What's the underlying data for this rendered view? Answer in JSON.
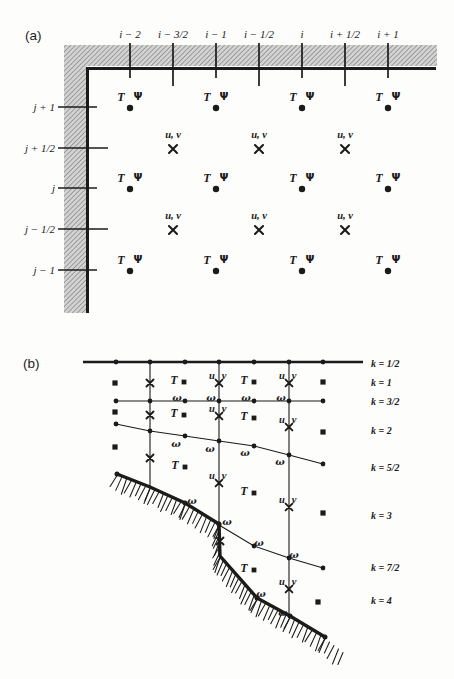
{
  "figure": {
    "ink_color": "#1b1b1b",
    "wall_fill": "#d3d3d3",
    "wall_line": "#7f7f7f",
    "panel_a": {
      "label": "(a)",
      "point_labels": {
        "t": "T",
        "psi": "Ψ",
        "uv": "u, v"
      },
      "columns": [
        {
          "label": "i − 2",
          "x": 130,
          "half": false
        },
        {
          "label": "i − 3/2",
          "x": 173,
          "half": true
        },
        {
          "label": "i − 1",
          "x": 216,
          "half": false
        },
        {
          "label": "i − 1/2",
          "x": 259,
          "half": true
        },
        {
          "label": "i",
          "x": 302,
          "half": false
        },
        {
          "label": "i + 1/2",
          "x": 345,
          "half": true
        },
        {
          "label": "i + 1",
          "x": 388,
          "half": false
        }
      ],
      "rows": [
        {
          "label": "j + 1",
          "y": 107,
          "half": false
        },
        {
          "label": "j + 1/2",
          "y": 148,
          "half": true
        },
        {
          "label": "j",
          "y": 188,
          "half": false
        },
        {
          "label": "j − 1/2",
          "y": 229,
          "half": true
        },
        {
          "label": "j − 1",
          "y": 270,
          "half": false
        }
      ],
      "wall": {
        "top_band": [
          64,
          45,
          373,
          21
        ],
        "left_band": [
          64,
          45,
          23,
          268
        ],
        "boundary": "M436 68.5 L87.5 68.5 L87.5 313"
      }
    },
    "panel_b": {
      "label": "(b)",
      "point_labels": {
        "t": "T",
        "u": "u",
        "v": "v",
        "omega": "ω"
      },
      "vertical_lines": [
        [
          150,
          362,
          487
        ],
        [
          219,
          362,
          555
        ],
        [
          289,
          362,
          616
        ]
      ],
      "levels": [
        {
          "thick": true,
          "pts": [
            [
              83,
              362
            ],
            [
              363,
              362
            ]
          ],
          "dots": [
            [
              116,
              362
            ],
            [
              150,
              362
            ],
            [
              185,
              362
            ],
            [
              219,
              362
            ],
            [
              254,
              362
            ],
            [
              289,
              362
            ],
            [
              323,
              362
            ]
          ],
          "omegas": []
        },
        {
          "thick": false,
          "pts": [
            [
              116,
              401
            ],
            [
              323,
              401
            ]
          ],
          "dots": [
            [
              116,
              401
            ],
            [
              150,
              401
            ],
            [
              185,
              401
            ],
            [
              219,
              401
            ],
            [
              254,
              401
            ],
            [
              289,
              401
            ],
            [
              323,
              401
            ]
          ],
          "omegas": [
            [
              177,
              398
            ],
            [
              211,
              398
            ],
            [
              246,
              398
            ],
            [
              281,
              398
            ]
          ]
        },
        {
          "thick": false,
          "pts": [
            [
              116,
              424
            ],
            [
              150,
              431
            ],
            [
              185,
              436
            ],
            [
              219,
              441
            ],
            [
              254,
              446
            ],
            [
              289,
              455
            ],
            [
              323,
              464
            ]
          ],
          "dots": [
            [
              116,
              424
            ],
            [
              150,
              431
            ],
            [
              185,
              436
            ],
            [
              219,
              441
            ],
            [
              254,
              446
            ],
            [
              289,
              455
            ],
            [
              323,
              464
            ]
          ],
          "omegas": [
            [
              176,
              444
            ],
            [
              210,
              449
            ],
            [
              245,
              453
            ],
            [
              280,
              462
            ]
          ]
        },
        {
          "thick": false,
          "pts": [
            [
              219,
              525
            ],
            [
              254,
              546
            ],
            [
              289,
              558
            ],
            [
              323,
              568
            ]
          ],
          "dots": [
            [
              219,
              525
            ],
            [
              254,
              546
            ],
            [
              289,
              558
            ],
            [
              323,
              568
            ]
          ],
          "omegas": [
            [
              259,
              543
            ],
            [
              294,
              555
            ]
          ]
        }
      ],
      "bottom": {
        "pts": [
          [
            117,
            474
          ],
          [
            150,
            487
          ],
          [
            185,
            503
          ],
          [
            219,
            524
          ],
          [
            220,
            556
          ],
          [
            257,
            598
          ],
          [
            290,
            616
          ],
          [
            325,
            637
          ]
        ],
        "hatch_tail": [
          343,
          651
        ],
        "dots": [
          [
            117,
            474
          ],
          [
            185,
            503
          ],
          [
            219,
            524
          ],
          [
            257,
            598
          ],
          [
            290,
            616
          ],
          [
            325,
            637
          ]
        ],
        "omegas": [
          [
            192,
            501
          ],
          [
            227,
            522
          ],
          [
            261,
            594
          ],
          [
            283,
            613
          ]
        ]
      },
      "rows": [
        {
          "k": "1",
          "items": [
            [
              "sq",
              115,
              383
            ],
            [
              "x",
              150,
              383
            ],
            [
              "T",
              184,
              382
            ],
            [
              "uv",
              219,
              383
            ],
            [
              "T",
              254,
              382
            ],
            [
              "uv",
              289,
              383
            ],
            [
              "sq",
              323,
              382
            ]
          ]
        },
        {
          "k": "2",
          "items": [
            [
              "sq",
              115,
              412
            ],
            [
              "x",
              150,
              415
            ],
            [
              "T",
              184,
              415
            ],
            [
              "uv",
              219,
              416
            ],
            [
              "T",
              254,
              418
            ],
            [
              "uv",
              289,
              427
            ],
            [
              "sq",
              323,
              432
            ]
          ]
        },
        {
          "k": "3",
          "items": [
            [
              "sq",
              115,
              447
            ],
            [
              "x",
              150,
              458
            ],
            [
              "T",
              185,
              467
            ],
            [
              "uv",
              219,
              483
            ],
            [
              "T",
              254,
              493
            ],
            [
              "uv",
              289,
              507
            ],
            [
              "sq",
              323,
              513
            ]
          ]
        },
        {
          "k": "4",
          "items": [
            [
              "x",
              220,
              541
            ],
            [
              "T",
              254,
              570
            ],
            [
              "uv",
              289,
              589
            ],
            [
              "sq",
              318,
              602
            ]
          ]
        }
      ],
      "k_labels": [
        {
          "label": "k = 1/2",
          "y": 363
        },
        {
          "label": "k = 1",
          "y": 382
        },
        {
          "label": "k = 3/2",
          "y": 401
        },
        {
          "label": "k = 2",
          "y": 430
        },
        {
          "label": "k = 5/2",
          "y": 467
        },
        {
          "label": "k = 3",
          "y": 515
        },
        {
          "label": "k = 7/2",
          "y": 567
        },
        {
          "label": "k = 4",
          "y": 600
        }
      ],
      "k_label_x": 371
    }
  }
}
